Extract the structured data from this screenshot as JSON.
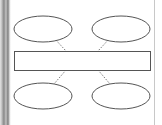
{
  "diagram": {
    "type": "hub-and-spoke",
    "center": {
      "shape": "rectangle",
      "label": ""
    },
    "nodes": [
      {
        "id": "top-left",
        "shape": "ellipse",
        "label": ""
      },
      {
        "id": "top-right",
        "shape": "ellipse",
        "label": ""
      },
      {
        "id": "bottom-left",
        "shape": "ellipse",
        "label": ""
      },
      {
        "id": "bottom-right",
        "shape": "ellipse",
        "label": ""
      }
    ],
    "connectors": [
      {
        "from": "top-left",
        "to": "center",
        "style": "dotted"
      },
      {
        "from": "top-right",
        "to": "center",
        "style": "dotted"
      },
      {
        "from": "center",
        "to": "bottom-left",
        "style": "dotted"
      },
      {
        "from": "center",
        "to": "bottom-right",
        "style": "dotted"
      }
    ],
    "colors": {
      "stroke": "#555555",
      "fill": "#ffffff",
      "connector": "#777777",
      "panel_edge": "#9a9a9a"
    }
  }
}
